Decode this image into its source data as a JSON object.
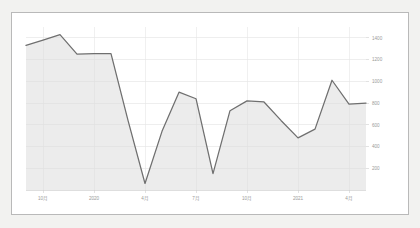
{
  "panel": {
    "background": "#ffffff",
    "border_color": "#b9b9b9",
    "outer_background": "#f2f2f0"
  },
  "chart_data": {
    "type": "area",
    "title": "",
    "subtitle": "",
    "xlabel": "",
    "ylabel": "",
    "grid": true,
    "legend": false,
    "legend_position": "none",
    "line_color": "#6f6f6f",
    "area_color": "#dcdcdc",
    "ylim": [
      0,
      1500
    ],
    "yticks": [
      1400,
      1200,
      1000,
      800,
      600,
      400,
      200
    ],
    "ytick_labels": [
      "1400",
      "1200",
      "1000",
      "800",
      "600",
      "400",
      "200"
    ],
    "xtick_labels": [
      "10月",
      "2020",
      "4月",
      "7月",
      "10月",
      "2021",
      "4月"
    ],
    "x": [
      "2019-09",
      "2019-10",
      "2019-11",
      "2019-12",
      "2020-01",
      "2020-02",
      "2020-03",
      "2020-04",
      "2020-05",
      "2020-06",
      "2020-07",
      "2020-08",
      "2020-09",
      "2020-10",
      "2020-11",
      "2020-12",
      "2021-01",
      "2021-02",
      "2021-03",
      "2021-04",
      "2021-05"
    ],
    "categories": [
      "2019-09",
      "2019-10",
      "2019-11",
      "2019-12",
      "2020-01",
      "2020-02",
      "2020-03",
      "2020-04",
      "2020-05",
      "2020-06",
      "2020-07",
      "2020-08",
      "2020-09",
      "2020-10",
      "2020-11",
      "2020-12",
      "2021-01",
      "2021-02",
      "2021-03",
      "2021-04",
      "2021-05"
    ],
    "values": [
      1330,
      1380,
      1430,
      1250,
      1255,
      1255,
      640,
      60,
      540,
      900,
      840,
      150,
      730,
      820,
      810,
      640,
      480,
      560,
      1010,
      790,
      800
    ],
    "series": [
      {
        "name": "series-1",
        "values": [
          1330,
          1380,
          1430,
          1250,
          1255,
          1255,
          640,
          60,
          540,
          900,
          840,
          150,
          730,
          820,
          810,
          640,
          480,
          560,
          1010,
          790,
          800
        ]
      }
    ]
  }
}
